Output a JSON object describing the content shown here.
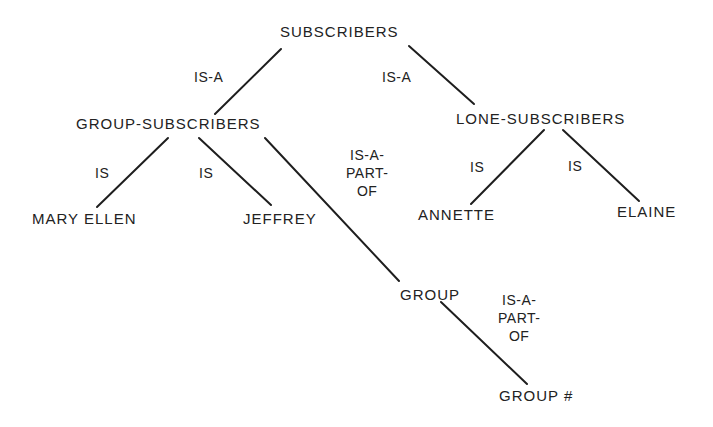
{
  "diagram": {
    "type": "hierarchy-tree",
    "nodes": {
      "subscribers": "SUBSCRIBERS",
      "group_subscribers": "GROUP-SUBSCRIBERS",
      "lone_subscribers": "LONE-SUBSCRIBERS",
      "mary_ellen": "MARY ELLEN",
      "jeffrey": "JEFFREY",
      "annette": "ANNETTE",
      "elaine": "ELAINE",
      "group": "GROUP",
      "group_number": "GROUP #"
    },
    "edge_labels": {
      "subscribers_to_group_subscribers": "IS-A",
      "subscribers_to_lone_subscribers": "IS-A",
      "group_subscribers_to_mary_ellen": "IS",
      "group_subscribers_to_jeffrey": "IS",
      "group_subscribers_to_group": [
        "IS-A-",
        "PART-",
        "OF"
      ],
      "lone_subscribers_to_annette": "IS",
      "lone_subscribers_to_elaine": "IS",
      "group_to_group_number": [
        "IS-A-",
        "PART-",
        "OF"
      ]
    },
    "edges": [
      {
        "from": "SUBSCRIBERS",
        "to": "GROUP-SUBSCRIBERS",
        "label": "IS-A"
      },
      {
        "from": "SUBSCRIBERS",
        "to": "LONE-SUBSCRIBERS",
        "label": "IS-A"
      },
      {
        "from": "GROUP-SUBSCRIBERS",
        "to": "MARY ELLEN",
        "label": "IS"
      },
      {
        "from": "GROUP-SUBSCRIBERS",
        "to": "JEFFREY",
        "label": "IS"
      },
      {
        "from": "GROUP-SUBSCRIBERS",
        "to": "GROUP",
        "label": "IS-A-PART-OF"
      },
      {
        "from": "LONE-SUBSCRIBERS",
        "to": "ANNETTE",
        "label": "IS"
      },
      {
        "from": "LONE-SUBSCRIBERS",
        "to": "ELAINE",
        "label": "IS"
      },
      {
        "from": "GROUP",
        "to": "GROUP #",
        "label": "IS-A-PART-OF"
      }
    ],
    "colors": {
      "background": "#ffffff",
      "ink": "#1e1e1e"
    }
  }
}
